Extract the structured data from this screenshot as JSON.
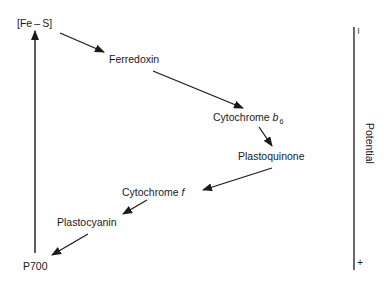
{
  "diagram": {
    "nodes": {
      "fes": "[Fe – S]",
      "ferredoxin": "Ferredoxin",
      "cytb6_main": "Cytochrome ",
      "cytb6_italic": "b",
      "cytb6_sub": "6",
      "plastoquinone": "Plastoquinone",
      "cytf_main": "Cytochrome ",
      "cytf_italic": "f",
      "plastocyanin": "Plastocyanin",
      "p700": "P700"
    },
    "axis": {
      "label": "Potential",
      "top_sign": "–",
      "bottom_sign": "+"
    },
    "colors": {
      "ink": "#1a1a1a",
      "background": "#ffffff"
    }
  }
}
